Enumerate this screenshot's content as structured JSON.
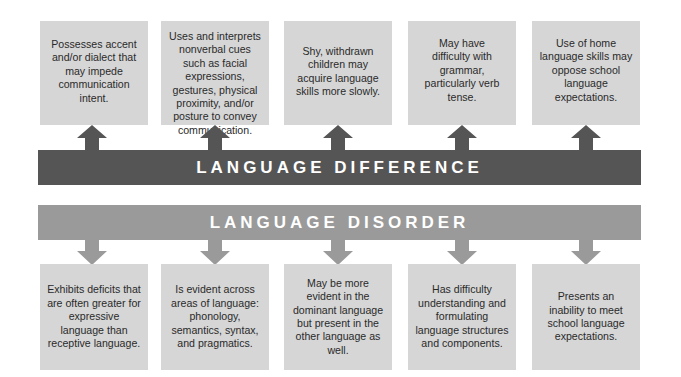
{
  "diagram": {
    "difference_bar": {
      "label": "LANGUAGE DIFFERENCE",
      "color": "#555555"
    },
    "disorder_bar": {
      "label": "LANGUAGE DISORDER",
      "color": "#9a9a9a"
    },
    "box_color": "#d6d6d6",
    "difference_boxes": [
      {
        "text": "Possesses accent and/or dialect that may impede communication intent."
      },
      {
        "text": "Uses and interprets nonverbal cues such as facial expressions, gestures, physical proximity, and/or posture to convey communication."
      },
      {
        "text": "Shy, withdrawn children may acquire language skills more slowly."
      },
      {
        "text": "May have difficulty with grammar, particularly verb tense."
      },
      {
        "text": "Use of home language skills may oppose school language expectations."
      }
    ],
    "disorder_boxes": [
      {
        "text": "Exhibits deficits that are often greater for expressive language than receptive language."
      },
      {
        "text": "Is evident across areas of language: phonology, semantics, syntax, and pragmatics."
      },
      {
        "text": "May be more evident in the dominant language but present in the other language as well."
      },
      {
        "text": "Has difficulty understanding and formulating language structures and components."
      },
      {
        "text": "Presents an inability to meet school language expectations."
      }
    ]
  }
}
